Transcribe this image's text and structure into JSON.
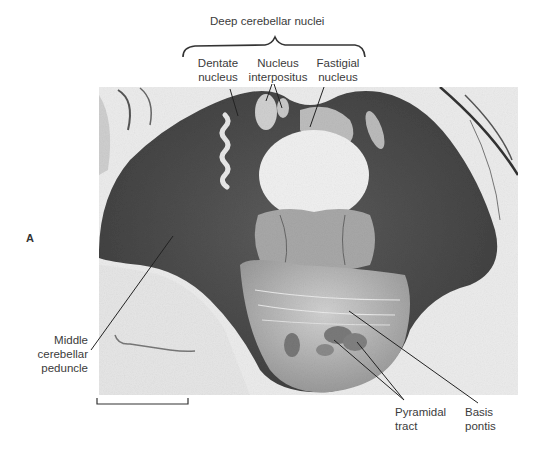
{
  "figure": {
    "panel_letter": "A",
    "group_label": "Deep cerebellar nuclei",
    "labels": {
      "dentate": [
        "Dentate",
        "nucleus"
      ],
      "interpositus": [
        "Nucleus",
        "interpositus"
      ],
      "fastigial": [
        "Fastigial",
        "nucleus"
      ],
      "middle_peduncle": [
        "Middle",
        "cerebellar",
        "peduncle"
      ],
      "pyramidal": [
        "Pyramidal",
        "tract"
      ],
      "basis": [
        "Basis",
        "pontis"
      ]
    },
    "colors": {
      "background": "#ffffff",
      "tissue_dark": "#4a4a4a",
      "tissue_mid": "#7a7a7a",
      "tissue_light": "#d9d9d9",
      "photo_bg": "#ececec",
      "text": "#3b3b3b",
      "leader": "#222222"
    }
  }
}
